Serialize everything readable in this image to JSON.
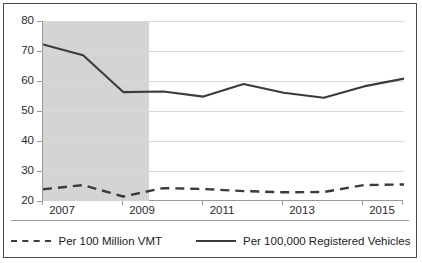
{
  "chart_data": {
    "type": "line",
    "title": "",
    "subtitle": "",
    "xlabel": "",
    "ylabel": "",
    "xlim": [
      2007,
      2016
    ],
    "ylim": [
      20,
      80
    ],
    "grid": true,
    "legend_position": "bottom",
    "y_ticks": [
      80,
      70,
      60,
      50,
      40,
      30,
      20
    ],
    "x_ticks": [
      2007,
      2009,
      2011,
      2013,
      2015
    ],
    "x": [
      2007,
      2008,
      2009,
      2010,
      2011,
      2012,
      2013,
      2014,
      2015,
      2016
    ],
    "series": [
      {
        "name": "Per 100 Million VMT",
        "style": "dashed",
        "color": "#3b3b3b",
        "values": [
          23.9,
          25.3,
          21.5,
          24.3,
          24.0,
          23.3,
          22.9,
          23.0,
          25.3,
          25.5
        ]
      },
      {
        "name": "Per 100,000 Registered Vehicles",
        "style": "solid",
        "color": "#3b3b3b",
        "values": [
          72.2,
          68.6,
          56.3,
          56.5,
          54.8,
          59.0,
          56.1,
          54.4,
          58.2,
          60.8
        ]
      }
    ],
    "annotations": [
      {
        "type": "shaded-band",
        "name": "recession-band",
        "x_start": 2007,
        "x_end": 2009.65,
        "color": "#d4d4d4"
      }
    ]
  },
  "axis": {
    "y_tick_labels": [
      "80",
      "70",
      "60",
      "50",
      "40",
      "30",
      "20"
    ],
    "x_tick_labels": [
      "2007",
      "2009",
      "2011",
      "2013",
      "2015"
    ]
  },
  "legend": {
    "entries": [
      {
        "label": "Per 100 Million VMT",
        "marker": "dashed-line-swatch"
      },
      {
        "label": "Per 100,000 Registered Vehicles",
        "marker": "solid-line-swatch"
      }
    ]
  }
}
